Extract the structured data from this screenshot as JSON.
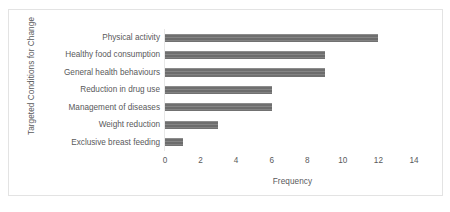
{
  "chart_data": {
    "type": "bar",
    "orientation": "horizontal",
    "title": "",
    "xlabel": "Frequency",
    "ylabel": "Targeted Conditions for Change",
    "categories": [
      "Physical activity",
      "Healthy food consumption",
      "General health behaviours",
      "Reduction in drug use",
      "Management of diseases",
      "Weight reduction",
      "Exclusive breast feeding"
    ],
    "values": [
      12,
      9,
      9,
      6,
      6,
      3,
      1
    ],
    "xlim": [
      0,
      14
    ],
    "xticks": [
      "0",
      "2",
      "4",
      "6",
      "8",
      "10",
      "12",
      "14"
    ],
    "xtick_values": [
      0,
      2,
      4,
      6,
      8,
      10,
      12,
      14
    ],
    "grid": false,
    "legend": false,
    "bar_color": "#767676",
    "text_color": "#59595b",
    "border_color": "#e3e3e3",
    "background": "#ffffff"
  }
}
